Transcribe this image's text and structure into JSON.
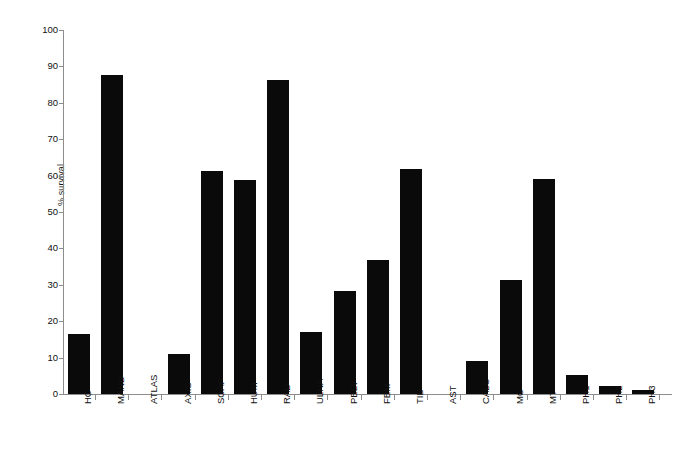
{
  "chart_data": {
    "type": "bar",
    "title": "",
    "xlabel": "",
    "ylabel": "% survival",
    "ylim": [
      0,
      100
    ],
    "yticks": [
      0,
      10,
      20,
      30,
      40,
      50,
      60,
      70,
      80,
      90,
      100
    ],
    "grid": false,
    "legend": "none",
    "bar_color": "#0a0a0a",
    "axis_color": "#8d8d8d",
    "categories": [
      "HC",
      "MAND",
      "ATLAS",
      "AXIS",
      "SCAP",
      "HUM",
      "RAD",
      "ULNA",
      "PELV",
      "FEM",
      "TIB",
      "AST",
      "CALC",
      "MC",
      "MT",
      "PH1",
      "PH2",
      "PH3"
    ],
    "values": [
      16.6,
      87.6,
      0,
      11.1,
      61.4,
      58.7,
      86.3,
      16.9,
      28.3,
      36.7,
      61.7,
      0,
      9.0,
      31.3,
      59.1,
      5.1,
      2.3,
      1.2
    ]
  }
}
